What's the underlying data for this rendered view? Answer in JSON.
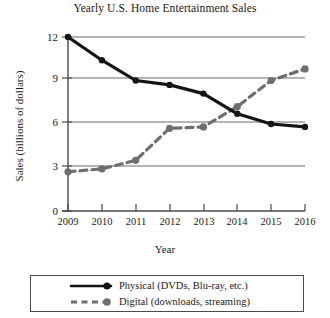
{
  "chart_data": {
    "type": "line",
    "title": "Yearly U.S. Home Entertainment Sales",
    "xlabel": "Year",
    "ylabel": "Sales (billions of dollars)",
    "categories": [
      "2009",
      "2010",
      "2011",
      "2012",
      "2013",
      "2014",
      "2015",
      "2016"
    ],
    "x": [
      2009,
      2010,
      2011,
      2012,
      2013,
      2014,
      2015,
      2016
    ],
    "xlim": [
      2009,
      2016
    ],
    "ylim": [
      0,
      12
    ],
    "yticks": [
      "0",
      "3",
      "6",
      "9",
      "12"
    ],
    "ytick_values": [
      0,
      3,
      6,
      9,
      12
    ],
    "grid": "horizontal",
    "legend_position": "below-plot",
    "series": [
      {
        "name": "Physical (DVDs, Blu-ray, etc.)",
        "values": [
          12.0,
          10.4,
          9.0,
          8.7,
          8.1,
          6.7,
          6.0,
          5.8
        ],
        "color": "#141414",
        "style": "solid",
        "marker": "circle"
      },
      {
        "name": "Digital (downloads, streaming)",
        "values": [
          2.7,
          2.9,
          3.5,
          5.7,
          5.8,
          7.2,
          9.0,
          9.8
        ],
        "color": "#6e6e6e",
        "style": "dashed",
        "marker": "circle"
      }
    ]
  },
  "legend": {
    "items": [
      {
        "label": "Physical (DVDs, Blu-ray, etc.)"
      },
      {
        "label": "Digital (downloads, streaming)"
      }
    ]
  }
}
